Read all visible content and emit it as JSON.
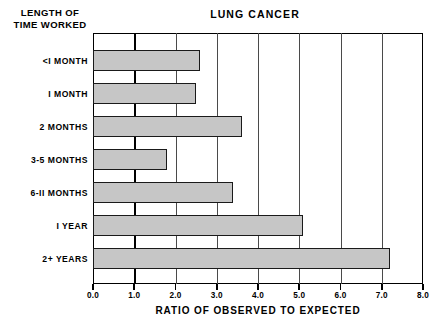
{
  "header": {
    "y_axis_header_line1": "LENGTH OF",
    "y_axis_header_line2": "TIME WORKED"
  },
  "chart_data": {
    "type": "bar",
    "orientation": "horizontal",
    "title": "LUNG CANCER",
    "xlabel": "RATIO OF OBSERVED TO EXPECTED",
    "ylabel": "LENGTH OF TIME WORKED",
    "categories": [
      "<I MONTH",
      "I MONTH",
      "2 MONTHS",
      "3-5 MONTHS",
      "6-II MONTHS",
      "I YEAR",
      "2+ YEARS"
    ],
    "values": [
      2.6,
      2.5,
      3.6,
      1.8,
      3.4,
      5.1,
      7.2
    ],
    "xlim": [
      0.0,
      8.0
    ],
    "xticks": [
      0.0,
      1.0,
      2.0,
      3.0,
      4.0,
      5.0,
      6.0,
      7.0,
      8.0
    ],
    "xtick_labels": [
      "0.0",
      "1.0",
      "2.0",
      "3.0",
      "4.0",
      "5.0",
      "6.0",
      "7.0",
      "8.0"
    ],
    "grid": true,
    "grid_axis": "x",
    "reference_line": 1.0,
    "legend": null,
    "bar_fill_color": "#c6c6c6",
    "bar_edge_color": "#1a1a1a",
    "frame_color": "#000000",
    "background_color": "#ffffff"
  }
}
